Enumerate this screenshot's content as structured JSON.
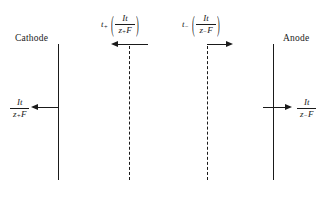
{
  "diagram": {
    "background_color": "#ffffff",
    "line_color": "#1a1a1a"
  },
  "electrodes": {
    "cathode_label": "Cathode",
    "anode_label": "Anode"
  },
  "formulas": {
    "cathode_flux": {
      "numerator": "It",
      "denominator_z": "z",
      "denominator_sign": "+",
      "denominator_F": "F"
    },
    "anode_flux": {
      "numerator": "It",
      "denominator_z": "z",
      "denominator_sign": "−",
      "denominator_F": "F"
    },
    "cation_transport": {
      "transport_symbol": "t",
      "transport_sign": "+",
      "open_paren": "(",
      "close_paren": ")",
      "numerator": "It",
      "denominator_z": "z",
      "denominator_sign": "+",
      "denominator_F": "F"
    },
    "anion_transport": {
      "transport_symbol": "t",
      "transport_sign": "−",
      "open_paren": "(",
      "close_paren": ")",
      "numerator": "It",
      "denominator_z": "z",
      "denominator_sign": "−",
      "denominator_F": "F"
    }
  }
}
